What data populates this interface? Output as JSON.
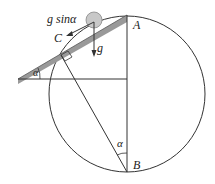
{
  "diagram": {
    "labels": {
      "A": "A",
      "B": "B",
      "C": "C",
      "g": "g",
      "gsin": "g sinα",
      "alpha_top": "α",
      "alpha_bottom": "α"
    },
    "colors": {
      "line": "#333333",
      "incline": "#999999",
      "ball": "#c8c8c8"
    }
  }
}
